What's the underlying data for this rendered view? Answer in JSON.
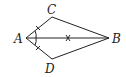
{
  "diagram": {
    "type": "geometry",
    "points": {
      "A": {
        "label": "A",
        "x": 26,
        "y": 38
      },
      "B": {
        "label": "B",
        "x": 109,
        "y": 38
      },
      "C": {
        "label": "C",
        "x": 52,
        "y": 17
      },
      "D": {
        "label": "D",
        "x": 52,
        "y": 59
      }
    },
    "segments": [
      "AC",
      "CB",
      "AD",
      "DB",
      "AB"
    ],
    "marks": {
      "equal_ticks": [
        "AC",
        "AD"
      ],
      "cross_mark": "AB",
      "angle_arc": "CAD"
    }
  }
}
